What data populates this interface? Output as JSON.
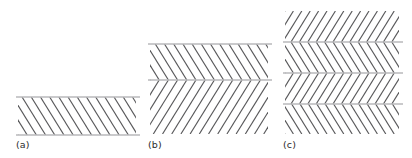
{
  "figure": {
    "type": "diagram",
    "background_color": "#ffffff",
    "hatch_color": "#58585a",
    "rule_color": "#b9b9bb",
    "label_color": "#2b2b2b",
    "canvas": {
      "width": 412,
      "height": 158
    }
  },
  "panels": [
    {
      "id": "a",
      "label": "(a)",
      "layer_count": 1,
      "x": 18,
      "y": 97,
      "width": 118,
      "height": 38,
      "label_x": 16,
      "label_y": 140,
      "hatch_spacing": 9.2,
      "hatch_line_width": 1.15,
      "layers": [
        {
          "index": 0,
          "direction": "backslash",
          "top": 0,
          "height": 38
        }
      ],
      "rules": [
        {
          "position": "top",
          "y": 0
        },
        {
          "position": "bottom",
          "y": 38
        }
      ]
    },
    {
      "id": "b",
      "label": "(b)",
      "layer_count": 2,
      "x": 150,
      "y": 44,
      "width": 118,
      "height": 90,
      "label_x": 148,
      "label_y": 140,
      "hatch_spacing": 9.2,
      "hatch_line_width": 1.15,
      "layers": [
        {
          "index": 0,
          "direction": "backslash",
          "top": 0,
          "height": 36
        },
        {
          "index": 1,
          "direction": "slash",
          "top": 36,
          "height": 54
        }
      ],
      "rules": [
        {
          "position": "top",
          "y": 0
        },
        {
          "position": "middle",
          "y": 36
        }
      ]
    },
    {
      "id": "c",
      "label": "(c)",
      "layer_count": 4,
      "x": 285,
      "y": 11,
      "width": 114,
      "height": 123,
      "label_x": 283,
      "label_y": 140,
      "hatch_spacing": 8.4,
      "hatch_line_width": 1.15,
      "layers": [
        {
          "index": 0,
          "direction": "slash",
          "top": 0,
          "height": 31
        },
        {
          "index": 1,
          "direction": "backslash",
          "top": 31,
          "height": 31
        },
        {
          "index": 2,
          "direction": "slash",
          "top": 62,
          "height": 31
        },
        {
          "index": 3,
          "direction": "backslash",
          "top": 93,
          "height": 30
        }
      ],
      "rules": [
        {
          "position": "interior-1",
          "y": 31
        },
        {
          "position": "interior-2",
          "y": 62
        },
        {
          "position": "interior-3",
          "y": 93
        }
      ]
    }
  ]
}
